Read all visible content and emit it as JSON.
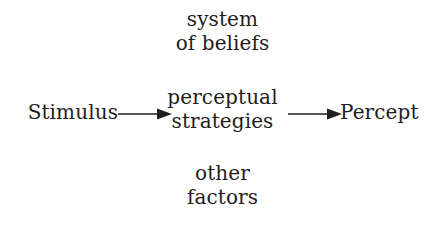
{
  "diagram": {
    "background_color": "#ffffff",
    "text_color": "#1f1d1d",
    "nodes": {
      "stimulus": {
        "label": "Stimulus"
      },
      "system_of_beliefs": {
        "line1": "system",
        "line2": "of beliefs"
      },
      "perceptual_strategies": {
        "line1": "perceptual",
        "line2": "strategies"
      },
      "other_factors": {
        "line1": "other",
        "line2": "factors"
      },
      "percept": {
        "label": "Percept"
      }
    },
    "arrows": [
      {
        "name": "stimulus-to-strategies",
        "from": "Stimulus",
        "to": "perceptual strategies",
        "direction": "right"
      },
      {
        "name": "strategies-to-percept",
        "from": "perceptual strategies",
        "to": "Percept",
        "direction": "right"
      }
    ]
  }
}
